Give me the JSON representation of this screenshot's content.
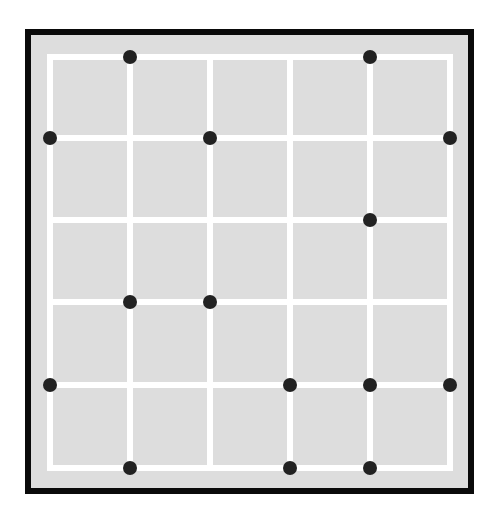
{
  "puzzle": {
    "grid": {
      "columns": 5,
      "rows": 5,
      "line_x": [
        50,
        130,
        210,
        290,
        370,
        450
      ],
      "line_y": [
        57,
        138,
        220,
        302,
        385,
        468
      ]
    },
    "colors": {
      "border": "#0a0a0a",
      "cell_fill": "#dddddd",
      "grid_line": "#ffffff",
      "dot": "#222222"
    },
    "dots": [
      {
        "col": 1,
        "row": 0
      },
      {
        "col": 4,
        "row": 0
      },
      {
        "col": 0,
        "row": 1
      },
      {
        "col": 2,
        "row": 1
      },
      {
        "col": 5,
        "row": 1
      },
      {
        "col": 4,
        "row": 2
      },
      {
        "col": 1,
        "row": 3
      },
      {
        "col": 2,
        "row": 3
      },
      {
        "col": 0,
        "row": 4
      },
      {
        "col": 3,
        "row": 4
      },
      {
        "col": 4,
        "row": 4
      },
      {
        "col": 5,
        "row": 4
      },
      {
        "col": 1,
        "row": 5
      },
      {
        "col": 3,
        "row": 5
      },
      {
        "col": 4,
        "row": 5
      }
    ]
  }
}
